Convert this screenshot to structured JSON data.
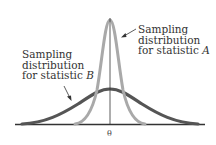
{
  "diagram": {
    "type": "sampling-distributions",
    "labels": {
      "a": {
        "line1": "Sampling",
        "line2": "distribution",
        "line3_prefix": "for statistic ",
        "stat": "A"
      },
      "b": {
        "line1": "Sampling",
        "line2": "distribution",
        "line3_prefix": "for statistic ",
        "stat": "B"
      }
    },
    "axis_label": "θ",
    "colors": {
      "curve_a": "#a9a9a9",
      "curve_b": "#555555",
      "axis": "#333333"
    }
  }
}
